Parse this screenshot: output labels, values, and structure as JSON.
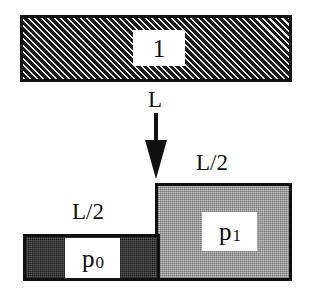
{
  "diagram": {
    "top_block": {
      "label": "1",
      "fill": "#1d1d1d",
      "hatch": "diagonal-light-on-dark",
      "border_color": "#111111"
    },
    "length_label": "L",
    "arrow": {
      "name": "down-arrow",
      "direction": "down",
      "color": "#111111"
    },
    "left_block": {
      "label": "p",
      "subscript": "0",
      "size_label": "L/2",
      "fill": "#5e5e5e",
      "border_color": "#111111"
    },
    "right_block": {
      "label": "p",
      "subscript": "1",
      "size_label": "L/2",
      "fill": "#c6c6c6",
      "border_color": "#111111"
    }
  }
}
